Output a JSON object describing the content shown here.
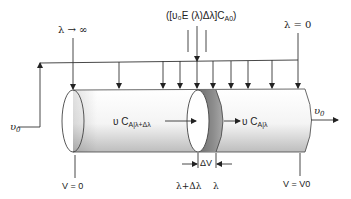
{
  "diagram": {
    "labels": {
      "lambda_inf": "λ → ∞",
      "side_feed": "([υ₀E (λ)Δλ]C",
      "side_feed_sub": "A0",
      "side_feed_close": ")",
      "lambda_zero": "λ = 0",
      "inlet_flow": "υ",
      "inlet_flow_sub": "0",
      "outlet_flow": "υ",
      "outlet_flow_sub": "0",
      "flux_in": "υ C",
      "flux_in_sub": "A|λ+Δλ",
      "flux_out": "υ C",
      "flux_out_sub": "A|λ",
      "delta_v": "ΔV",
      "lambda_plus": "λ+Δλ",
      "lambda": "λ",
      "v_zero": "V = 0",
      "v_end": "V = V0"
    },
    "colors": {
      "line": "#333333",
      "cylinder_light": "#ffffff",
      "cylinder_shade": "#c8c8c8",
      "slice_dark": "#7a7a7a",
      "slice_mid": "#9a9a9a"
    },
    "feed_arrows_x": [
      73,
      119,
      163,
      180,
      197,
      213,
      231,
      248,
      272,
      298
    ]
  }
}
